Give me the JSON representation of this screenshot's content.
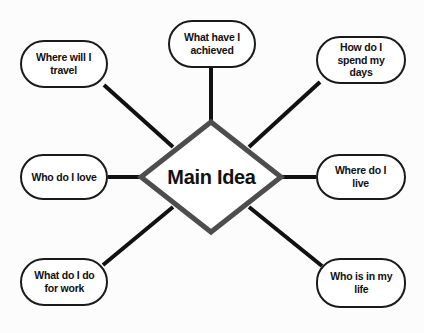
{
  "diagram": {
    "type": "mind-map",
    "background_color": "#fcfcfc",
    "center": {
      "label": "Main Idea",
      "shape": "diamond",
      "stroke_color": "#4d4d4d",
      "fill_color": "#ffffff",
      "cx": 211,
      "cy": 177,
      "half_width": 70,
      "half_height": 55
    },
    "branch_style": {
      "stroke_color": "#111111",
      "stroke_width": 4,
      "node_stroke_color": "#1a1a1a",
      "node_fill_color": "#ffffff",
      "node_shape": "rounded-rectangle"
    },
    "nodes": [
      {
        "id": "where-will-i-travel",
        "label": "Where will I\ntravel",
        "position": "top-left",
        "x": 20,
        "y": 40,
        "width": 88,
        "height": 48
      },
      {
        "id": "what-have-i-achieved",
        "label": "What have I\nachieved",
        "position": "top",
        "x": 168,
        "y": 20,
        "width": 88,
        "height": 48
      },
      {
        "id": "how-do-i-spend-my-days",
        "label": "How do I\nspend my days",
        "position": "top-right",
        "x": 316,
        "y": 36,
        "width": 90,
        "height": 48
      },
      {
        "id": "who-do-i-love",
        "label": "Who do I love",
        "position": "left",
        "x": 20,
        "y": 154,
        "width": 88,
        "height": 46
      },
      {
        "id": "where-do-i-live",
        "label": "Where do I\nlive",
        "position": "right",
        "x": 316,
        "y": 154,
        "width": 90,
        "height": 46
      },
      {
        "id": "what-do-i-do-for-work",
        "label": "What do I do\nfor work",
        "position": "bottom-left",
        "x": 20,
        "y": 258,
        "width": 88,
        "height": 48
      },
      {
        "id": "who-is-in-my-life",
        "label": "Who is in my\nlife",
        "position": "bottom-right",
        "x": 316,
        "y": 258,
        "width": 90,
        "height": 50
      }
    ],
    "edges": [
      {
        "id": "edge-top-left",
        "from": "center",
        "to": "where-will-i-travel",
        "x1": 173,
        "y1": 147,
        "x2": 104,
        "y2": 85
      },
      {
        "id": "edge-top",
        "from": "center",
        "to": "what-have-i-achieved",
        "x1": 211,
        "y1": 123,
        "x2": 211,
        "y2": 68
      },
      {
        "id": "edge-top-right",
        "from": "center",
        "to": "how-do-i-spend-my-days",
        "x1": 249,
        "y1": 147,
        "x2": 320,
        "y2": 82
      },
      {
        "id": "edge-left",
        "from": "center",
        "to": "who-do-i-love",
        "x1": 141,
        "y1": 177,
        "x2": 108,
        "y2": 177
      },
      {
        "id": "edge-right",
        "from": "center",
        "to": "where-do-i-live",
        "x1": 281,
        "y1": 177,
        "x2": 316,
        "y2": 177
      },
      {
        "id": "edge-bottom-left",
        "from": "center",
        "to": "what-do-i-do-for-work",
        "x1": 173,
        "y1": 207,
        "x2": 103,
        "y2": 265
      },
      {
        "id": "edge-bottom-right",
        "from": "center",
        "to": "who-is-in-my-life",
        "x1": 249,
        "y1": 207,
        "x2": 322,
        "y2": 266
      }
    ]
  }
}
